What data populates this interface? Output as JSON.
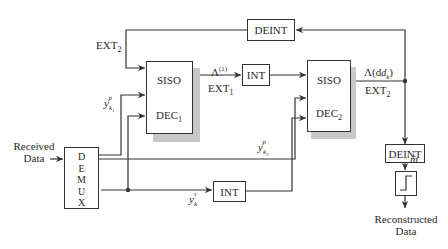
{
  "diagram": {
    "type": "turbo-decoder-block-diagram",
    "blocks": {
      "deint_top": "DEINT",
      "siso1_top": "SISO",
      "siso1_bottom": "DEC",
      "siso1_sub": "1",
      "siso2_top": "SISO",
      "siso2_bottom": "DEC",
      "siso2_sub": "2",
      "int_top": "INT",
      "int_bottom": "INT",
      "demux_letters": [
        "D",
        "E",
        "M",
        "U",
        "X"
      ],
      "deint_right": "DEINT"
    },
    "labels": {
      "ext2_feedback": "EXT",
      "ext2_feedback_sub": "2",
      "lambda1": "Λ",
      "lambda1_sup": "(1)",
      "ext1": "EXT",
      "ext1_sub": "1",
      "lambda_dk": "Λ(d",
      "lambda_dk_sub": "k",
      "lambda_dk_close": ")",
      "ext2_out": "EXT",
      "ext2_out_sub": "2",
      "y_k1p_left": "y",
      "y_k1p_left_sup": "p",
      "y_k1p_left_sub": "k",
      "y_k1p_left_subsub": "1",
      "y_k2p": "y",
      "y_k2p_sup": "p",
      "y_k2p_sub": "k",
      "y_k2p_subsub": "2",
      "y_ks": "y",
      "y_ks_sup": "s",
      "y_ks_sub": "k",
      "m_hat": "m̂",
      "received_line1": "Received",
      "received_line2": "Data",
      "reconstructed_line1": "Reconstructed",
      "reconstructed_line2": "Data"
    },
    "colors": {
      "line": "#333333",
      "shadow": "#c8c8c8",
      "background": "#ffffff"
    }
  }
}
